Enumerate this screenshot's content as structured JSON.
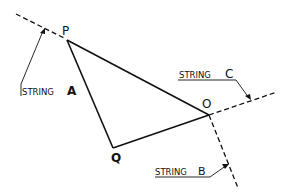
{
  "diagram": {
    "points": {
      "P": {
        "label": "P",
        "x": 67,
        "y": 40
      },
      "Q": {
        "label": "Q",
        "x": 113,
        "y": 148
      },
      "O": {
        "label": "O",
        "x": 209,
        "y": 115
      }
    },
    "strings": [
      {
        "id": "A",
        "prefix": "STRING",
        "letter": "A"
      },
      {
        "id": "B",
        "prefix": "STRING",
        "letter": "B"
      },
      {
        "id": "C",
        "prefix": "STRING",
        "letter": "C"
      }
    ],
    "colors": {
      "line": "#111111",
      "background": "#ffffff"
    }
  }
}
